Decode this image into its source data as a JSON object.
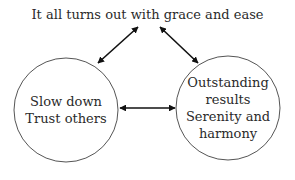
{
  "diagram": {
    "top_node": {
      "label": "It all turns out with grace and ease"
    },
    "left_node": {
      "lines": [
        "Slow down",
        "Trust others"
      ]
    },
    "right_node": {
      "lines": [
        "Outstanding",
        "results",
        "Serenity and",
        "harmony"
      ]
    },
    "edges": [
      {
        "from": "left_node",
        "to": "top_node",
        "type": "bidirectional"
      },
      {
        "from": "right_node",
        "to": "top_node",
        "type": "bidirectional"
      },
      {
        "from": "left_node",
        "to": "right_node",
        "type": "bidirectional"
      }
    ],
    "colors": {
      "stroke": "#555555",
      "arrow": "#111111",
      "text": "#2a2a2a",
      "background": "#ffffff"
    }
  }
}
